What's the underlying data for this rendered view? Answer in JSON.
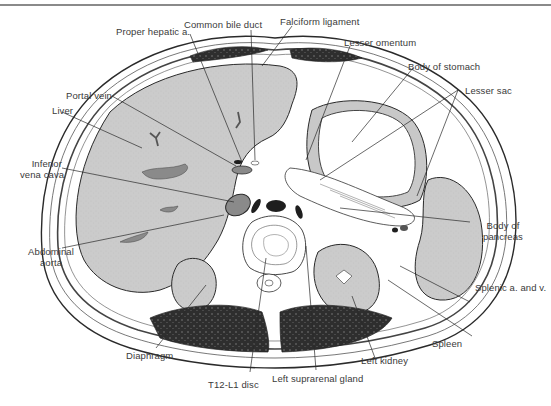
{
  "figure": {
    "colors": {
      "organ_fill": "#c8c8c8",
      "vessel_fill": "#8a8a8a",
      "muscle_fill": "#2e2e2e",
      "outline": "#2a2a2a",
      "background": "#ffffff",
      "label_text": "#3a3a3a"
    }
  },
  "labels": {
    "proper_hepatic_a": "Proper hepatic a.",
    "common_bile_duct": "Common bile duct",
    "falciform_ligament": "Falciform ligament",
    "lesser_omentum": "Lesser omentum",
    "body_of_stomach": "Body of stomach",
    "lesser_sac": "Lesser sac",
    "portal_vein": "Portal vein",
    "liver": "Liver",
    "inferior_vena_cava_1": "Inferior",
    "inferior_vena_cava_2": "vena cava",
    "abdominal_aorta_1": "Abdominal",
    "abdominal_aorta_2": "aorta",
    "body_of_pancreas_1": "Body of",
    "body_of_pancreas_2": "pancreas",
    "splenic_a_and_v": "Splenic a. and v.",
    "spleen": "Spleen",
    "left_kidney": "Left kidney",
    "left_suprarenal_gland": "Left suprarenal gland",
    "diaphragm": "Diaphragm",
    "t12_l1_disc": "T12-L1 disc"
  }
}
